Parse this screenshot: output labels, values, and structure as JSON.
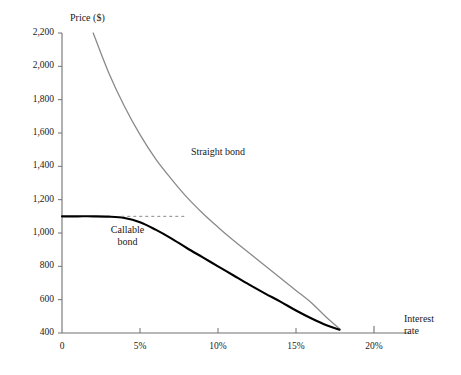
{
  "chart_data": {
    "type": "line",
    "title": "",
    "xlabel": "Interest rate",
    "ylabel": "Price ($)",
    "xlim": [
      0,
      20
    ],
    "ylim": [
      400,
      2200
    ],
    "grid": false,
    "legend_position": "inline-annotations",
    "x_ticks": [
      {
        "value": 0,
        "label": "0"
      },
      {
        "value": 5,
        "label": "5%"
      },
      {
        "value": 10,
        "label": "10%"
      },
      {
        "value": 15,
        "label": "15%"
      },
      {
        "value": 20,
        "label": "20%"
      }
    ],
    "y_ticks": [
      {
        "value": 400,
        "label": "400"
      },
      {
        "value": 600,
        "label": "600"
      },
      {
        "value": 800,
        "label": "800"
      },
      {
        "value": 1000,
        "label": "1,000"
      },
      {
        "value": 1200,
        "label": "1,200"
      },
      {
        "value": 1400,
        "label": "1,400"
      },
      {
        "value": 1600,
        "label": "1,600"
      },
      {
        "value": 1800,
        "label": "1,800"
      },
      {
        "value": 2000,
        "label": "2,000"
      },
      {
        "value": 2200,
        "label": "2,200"
      }
    ],
    "series": [
      {
        "name": "Straight bond",
        "color": "#8a8a8a",
        "width": 1.3,
        "dash": "none",
        "x": [
          2.0,
          3.0,
          4.0,
          5.0,
          6.0,
          7.0,
          8.0,
          9.0,
          10.0,
          11.0,
          12.0,
          13.0,
          14.0,
          15.0,
          16.0,
          17.0,
          17.8
        ],
        "values": [
          2200,
          1960,
          1760,
          1590,
          1445,
          1325,
          1215,
          1120,
          1035,
          955,
          880,
          805,
          730,
          655,
          580,
          490,
          425
        ]
      },
      {
        "name": "Callable bond",
        "color": "#000000",
        "width": 2.1,
        "dash": "none",
        "x": [
          0.0,
          1.0,
          2.0,
          3.0,
          4.0,
          5.0,
          6.0,
          7.0,
          8.0,
          9.0,
          10.0,
          11.0,
          12.0,
          13.0,
          14.0,
          15.0,
          16.0,
          17.0,
          17.8
        ],
        "values": [
          1100,
          1100,
          1100,
          1098,
          1090,
          1065,
          1020,
          968,
          910,
          855,
          800,
          745,
          690,
          638,
          588,
          535,
          487,
          445,
          420
        ]
      }
    ],
    "reference_line": {
      "name": "call-price-dashed",
      "orientation": "horizontal",
      "y": 1100,
      "x_start": 3.8,
      "x_end": 7.9,
      "color": "#8a8a8a",
      "dash": "3,3"
    },
    "annotations": [
      {
        "name": "straight-bond-label",
        "text": "Straight bond",
        "lines": [
          "Straight bond"
        ],
        "x": 10.0,
        "y": 1480
      },
      {
        "name": "callable-bond-label",
        "text": "Callable bond",
        "lines": [
          "Callable",
          "bond"
        ],
        "x": 4.2,
        "y": 1010
      }
    ]
  }
}
